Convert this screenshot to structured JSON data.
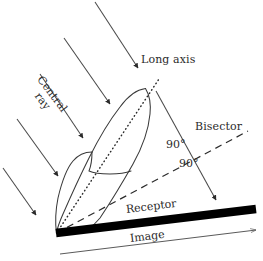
{
  "diagram": {
    "background_color": "#ffffff",
    "ink_color": "#2b2b2b",
    "receptor_color": "#000000",
    "labels": {
      "long_axis": "Long axis",
      "central_ray_line1": "Central",
      "central_ray_line2": "ray",
      "bisector": "Bisector",
      "angle_upper": "90°",
      "angle_lower": "90°",
      "receptor": "Receptor",
      "image": "Image"
    },
    "elements": {
      "x_ray_beam_arrows": 5,
      "tooth_outline": "tooth",
      "long_axis_style": "dotted",
      "bisector_style": "dashed",
      "central_ray_style": "solid-arrow",
      "receptor_style": "thick-black-bar",
      "image_dimension_style": "thin-arrow"
    }
  }
}
